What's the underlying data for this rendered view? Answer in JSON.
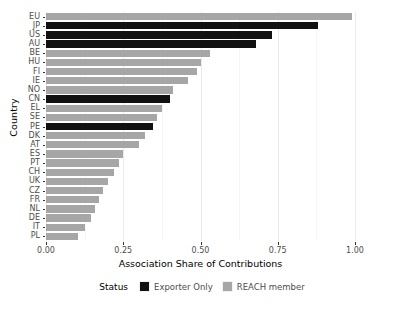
{
  "chart_data": {
    "type": "bar",
    "orientation": "horizontal",
    "title": "",
    "xlabel": "Association Share of Contributions",
    "ylabel": "Country",
    "xlim": [
      0.0,
      1.0
    ],
    "xticks": [
      "0.00",
      "0.25",
      "0.50",
      "0.75",
      "1.00"
    ],
    "xtick_values": [
      0.0,
      0.25,
      0.5,
      0.75,
      1.0
    ],
    "grid": true,
    "legend": {
      "title": "Status",
      "position": "bottom",
      "entries": [
        {
          "label": "Exporter Only",
          "color": "#111111",
          "key": "exporter"
        },
        {
          "label": "REACH member",
          "color": "#a6a6a6",
          "key": "reach"
        }
      ]
    },
    "categories": [
      "EU",
      "JP",
      "US",
      "AU",
      "BE",
      "HU",
      "FI",
      "IE",
      "NO",
      "CN",
      "EL",
      "SE",
      "PE",
      "DK",
      "AT",
      "ES",
      "PT",
      "CH",
      "UK",
      "CZ",
      "FR",
      "NL",
      "DE",
      "IT",
      "PL"
    ],
    "values": [
      0.99,
      0.88,
      0.73,
      0.68,
      0.53,
      0.5,
      0.49,
      0.46,
      0.41,
      0.4,
      0.375,
      0.36,
      0.345,
      0.32,
      0.3,
      0.25,
      0.235,
      0.22,
      0.2,
      0.185,
      0.17,
      0.16,
      0.145,
      0.125,
      0.105
    ],
    "status": [
      "REACH member",
      "Exporter Only",
      "Exporter Only",
      "Exporter Only",
      "REACH member",
      "REACH member",
      "REACH member",
      "REACH member",
      "REACH member",
      "Exporter Only",
      "REACH member",
      "REACH member",
      "Exporter Only",
      "REACH member",
      "REACH member",
      "REACH member",
      "REACH member",
      "REACH member",
      "REACH member",
      "REACH member",
      "REACH member",
      "REACH member",
      "REACH member",
      "REACH member",
      "REACH member"
    ],
    "colors": {
      "exporter_only": "#111111",
      "reach_member": "#a6a6a6",
      "grid": "#ebebeb",
      "background": "#ffffff"
    }
  }
}
